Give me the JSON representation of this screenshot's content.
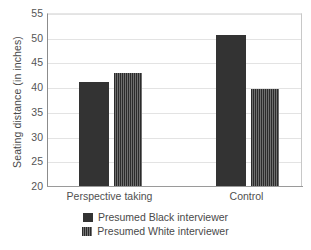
{
  "chart_data": {
    "type": "bar",
    "title": "",
    "subtitle": "",
    "xlabel": "",
    "ylabel": "Seating distance (in inches)",
    "categories": [
      "Perspective taking",
      "Control"
    ],
    "series": [
      {
        "name": "Presumed Black interviewer",
        "swatch": "solid",
        "color": "#333333",
        "values": [
          41.0,
          50.6
        ]
      },
      {
        "name": "Presumed White interviewer",
        "swatch": "vertical-stripes",
        "color": "#3a3a3a",
        "values": [
          42.9,
          39.7
        ]
      }
    ],
    "ylim": [
      20,
      55
    ],
    "yticks": [
      20,
      25,
      30,
      35,
      40,
      45,
      50,
      55
    ],
    "ytick_labels": [
      "20",
      "25",
      "30",
      "35",
      "40",
      "45",
      "50",
      "55"
    ],
    "grid": "horizontal",
    "legend_position": "bottom-center"
  },
  "legend": {
    "entries": [
      {
        "label": "Presumed Black interviewer",
        "swatch": "solid"
      },
      {
        "label": "Presumed White interviewer",
        "swatch": "striped"
      }
    ]
  },
  "colors": {
    "bar_solid": "#333333",
    "bar_striped": "#3a3a3a",
    "gridline": "#e3e3e3",
    "axis": "#9a9a9a",
    "text": "#4a4a4a",
    "background": "#ffffff"
  }
}
